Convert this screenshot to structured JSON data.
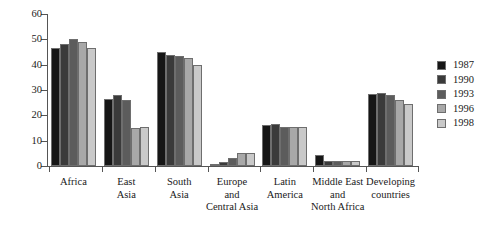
{
  "chart_data": {
    "type": "bar",
    "title": "",
    "subtitle": "",
    "xlabel": "",
    "ylabel": "",
    "ylim": [
      0,
      60
    ],
    "yticks": [
      0,
      10,
      20,
      30,
      40,
      50,
      60
    ],
    "ytick_labels": [
      "0",
      "10",
      "20",
      "30",
      "40",
      "50",
      "60"
    ],
    "grid": false,
    "legend_position": "right",
    "categories": [
      "Africa",
      "East Asia",
      "South Asia",
      "Europe and Central Asia",
      "Latin America",
      "Middle East and North Africa",
      "Developing countries"
    ],
    "category_label_lines": [
      [
        "Africa"
      ],
      [
        "East",
        "Asia"
      ],
      [
        "South",
        "Asia"
      ],
      [
        "Europe",
        "and",
        "Central Asia"
      ],
      [
        "Latin",
        "America"
      ],
      [
        "Middle East",
        "and",
        "North Africa"
      ],
      [
        "Developing",
        "countries"
      ]
    ],
    "series": [
      {
        "name": "1987",
        "color": "#161616",
        "values": [
          46.5,
          26.5,
          45.0,
          0.5,
          16.0,
          4.5,
          28.5
        ]
      },
      {
        "name": "1990",
        "color": "#3a3a3a",
        "values": [
          48.0,
          28.0,
          44.0,
          1.5,
          16.5,
          2.0,
          29.0
        ]
      },
      {
        "name": "1993",
        "color": "#5c5c5c",
        "values": [
          50.0,
          26.0,
          43.5,
          3.0,
          15.5,
          2.0,
          28.0
        ]
      },
      {
        "name": "1996",
        "color": "#a8a8a8",
        "values": [
          49.0,
          15.0,
          42.5,
          5.0,
          15.5,
          2.0,
          26.0
        ]
      },
      {
        "name": "1998",
        "color": "#c9c9c9",
        "values": [
          46.5,
          15.5,
          40.0,
          5.0,
          15.5,
          2.0,
          24.5
        ]
      }
    ]
  },
  "legend": {
    "entries": [
      "1987",
      "1990",
      "1993",
      "1996",
      "1998"
    ]
  }
}
